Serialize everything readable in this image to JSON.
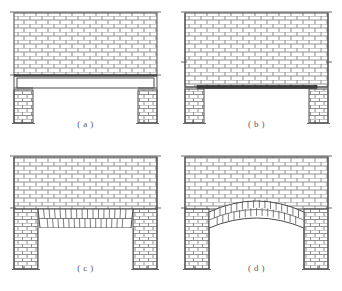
{
  "figure": {
    "layout": {
      "columns": 2,
      "rows": 2,
      "width": 342,
      "height": 291
    },
    "colors": {
      "brick_fill": "#ffffff",
      "mortar_line": "#8c8c8c",
      "outline": "#4a4a4a",
      "lintel_dark": "#2b2b2b",
      "caption_text": "#5a5a5a",
      "background": "#ffffff"
    },
    "panels": [
      {
        "id": "a",
        "caption": "( a )",
        "support_type": "reinforced concrete lintel",
        "description": "Brick wall carried on a deep plain rectangular lintel beam spanning between two brick piers",
        "wall_courses": 13,
        "lintel_style": "thick-plain-beam",
        "opening_span_ratio": 0.66
      },
      {
        "id": "b",
        "caption": "( b )",
        "support_type": "steel angle lintel",
        "description": "Brick wall continuing down to the opening head, carried on a thin dark steel bar between two brick piers",
        "wall_courses": 13,
        "lintel_style": "thin-steel-bar",
        "opening_span_ratio": 0.66
      },
      {
        "id": "c",
        "caption": "( c )",
        "support_type": "flat (jack) brick arch",
        "description": "Brick wall over a flat arch of near-vertical tapered voussoirs in two rows spanning the opening",
        "wall_courses": 13,
        "lintel_style": "flat-jack-arch",
        "voussoir_count": 17,
        "voussoir_rows": 2,
        "opening_span_ratio": 0.62
      },
      {
        "id": "d",
        "caption": "( d )",
        "support_type": "segmental brick arch",
        "description": "Brick wall over a shallow curved segmental arch of radial voussoirs in two rows",
        "wall_courses": 13,
        "lintel_style": "segmental-arch",
        "voussoir_count": 19,
        "voussoir_rows": 2,
        "arch_rise_px": 18,
        "opening_span_ratio": 0.62
      }
    ]
  }
}
